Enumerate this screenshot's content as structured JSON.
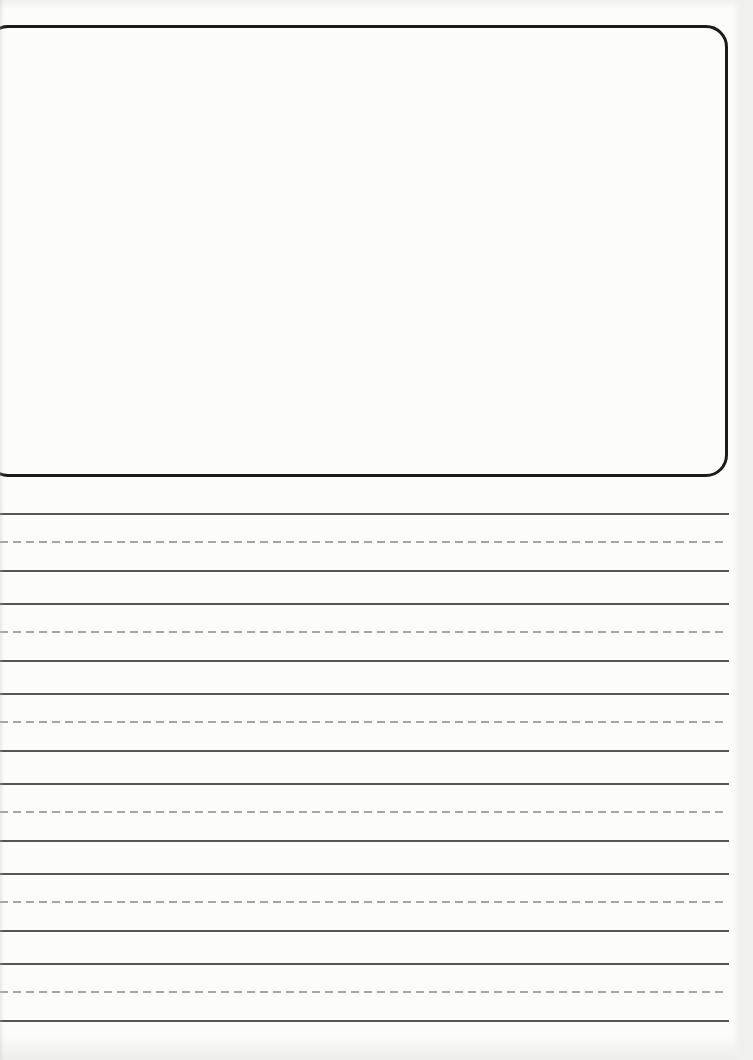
{
  "document": {
    "title": "",
    "visible_text": "",
    "description_of_content": "blank story/drawing worksheet: empty picture box above empty handwriting guide lines"
  },
  "colors": {
    "paper": "#fcfcfb",
    "scan-edge": "#f0f0ee",
    "box-border": "#1b1b1b",
    "solid-line": "#565659",
    "dashed-line": "#a6a6a6"
  },
  "drawing_box": {
    "content": ""
  },
  "writing_area": {
    "row_count": 6,
    "lines_per_row": 3,
    "line_pattern": [
      "solid",
      "dashed",
      "solid"
    ]
  }
}
